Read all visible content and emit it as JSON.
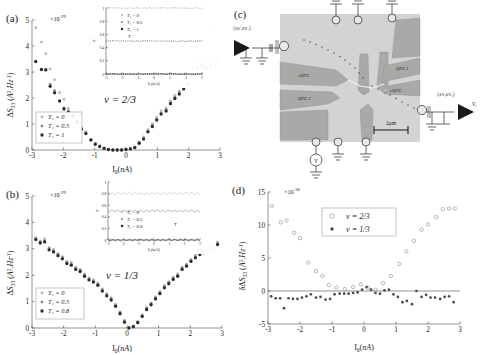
{
  "figure": {
    "panels": [
      "a",
      "b",
      "c",
      "d"
    ],
    "labels": {
      "a": "(a)",
      "b": "(b)",
      "c": "(c)",
      "d": "(d)"
    }
  },
  "panel_a": {
    "label": "(a)",
    "exponent": "×10",
    "exponent_sup": "-29",
    "annotation": "ν = 2/3",
    "legend": [
      {
        "marker": "light",
        "label": "T₁ = 0"
      },
      {
        "marker": "mid",
        "label": "T₁ = 0.5"
      },
      {
        "marker": "dark",
        "label": "T₁ = 1"
      }
    ],
    "inset": {
      "xlabel": "I₀(nA)",
      "ylabel": "T",
      "xticks": [
        "-3",
        "-2",
        "-1",
        "0",
        "1",
        "2",
        "3"
      ],
      "yticks": [
        "0",
        "0.2",
        "0.4",
        "0.6",
        "0.8",
        "1"
      ],
      "legend": [
        {
          "marker": "light",
          "label": "T₁ = 0"
        },
        {
          "marker": "mid",
          "label": "T₁ = 0.5"
        },
        {
          "marker": "dark",
          "label": "T₁ = 1"
        }
      ],
      "series_levels": [
        1.0,
        0.5,
        0.0
      ]
    },
    "chart_data": {
      "type": "scatter",
      "title": "",
      "xlabel": "I₀(nA)",
      "ylabel": "ΔS₃₃ (A².Hz⁻¹)",
      "xlim": [
        -3,
        3
      ],
      "ylim": [
        0,
        5
      ],
      "xticks": [
        -3,
        -2,
        -1,
        0,
        1,
        2,
        3
      ],
      "yticks": [
        0,
        1,
        2,
        3,
        4,
        5
      ],
      "yscale_exponent": -29,
      "grid": false,
      "legend_position": "lower-left",
      "series": [
        {
          "name": "T₁ = 0",
          "marker": "light",
          "x": [
            -2.88,
            -2.7,
            -2.56,
            -2.42,
            -2.28,
            -2.12,
            -1.98,
            -1.84,
            -1.7,
            -1.56,
            -1.42,
            -1.28,
            -1.12,
            -0.98,
            -0.84,
            -0.7,
            -0.56,
            -0.42,
            -0.28,
            -0.14,
            0,
            0.14,
            0.28,
            0.42,
            0.56,
            0.7,
            0.84,
            0.98,
            1.12,
            1.28,
            1.42,
            1.56,
            1.7,
            1.84,
            1.98,
            2.12,
            2.28,
            2.42,
            2.56,
            2.7,
            2.88
          ],
          "y": [
            4.7,
            4.15,
            3.7,
            3.12,
            2.7,
            2.2,
            1.95,
            1.6,
            1.42,
            1.12,
            0.86,
            0.7,
            0.42,
            0.26,
            0.16,
            0.08,
            0.03,
            0.0,
            0.0,
            0.0,
            0.03,
            0.05,
            0.12,
            0.3,
            0.5,
            0.78,
            1.0,
            1.25,
            1.5,
            1.62,
            1.9,
            2.1,
            2.26,
            2.55,
            2.8,
            3.1,
            3.35,
            3.6,
            4.15,
            4.6,
            4.72
          ]
        },
        {
          "name": "T₁ = 0.5",
          "marker": "mid",
          "x": [
            -2.88,
            -2.7,
            -2.56,
            -2.42,
            -2.28,
            -2.12,
            -1.98,
            -1.84,
            -1.7,
            -1.56,
            -1.42,
            -1.28,
            -1.12,
            -0.98,
            -0.84,
            -0.7,
            -0.56,
            -0.42,
            -0.28,
            -0.14,
            0,
            0.14,
            0.28,
            0.42,
            0.56,
            0.7,
            0.84,
            0.98,
            1.12,
            1.28,
            1.42,
            1.56,
            1.7,
            1.84,
            1.98,
            2.12,
            2.28,
            2.42,
            2.56,
            2.7,
            2.88
          ],
          "y": [
            3.42,
            3.08,
            3.1,
            2.52,
            2.28,
            1.9,
            1.62,
            1.5,
            1.35,
            1.08,
            0.82,
            0.66,
            0.4,
            0.24,
            0.15,
            0.07,
            0.02,
            0.0,
            0.0,
            0.0,
            0.02,
            0.05,
            0.1,
            0.28,
            0.45,
            0.72,
            0.95,
            1.18,
            1.42,
            1.55,
            1.82,
            2.02,
            2.2,
            2.42,
            2.6,
            2.9,
            3.18,
            3.3,
            3.2,
            3.25,
            3.3
          ]
        },
        {
          "name": "T₁ = 1",
          "marker": "dark",
          "x": [
            -2.88,
            -2.7,
            -2.56,
            -2.42,
            -2.28,
            -2.12,
            -1.98,
            -1.84,
            -1.7,
            -1.56,
            -1.42,
            -1.28,
            -1.12,
            -0.98,
            -0.84,
            -0.7,
            -0.56,
            -0.42,
            -0.28,
            -0.14,
            0,
            0.14,
            0.28,
            0.42,
            0.56,
            0.7,
            0.84,
            0.98,
            1.12,
            1.28,
            1.42,
            1.56,
            1.7,
            1.84,
            1.98,
            2.12,
            2.28,
            2.42,
            2.56,
            2.7,
            2.88
          ],
          "y": [
            3.4,
            3.1,
            3.08,
            2.45,
            2.2,
            1.88,
            1.58,
            1.45,
            1.3,
            1.05,
            0.8,
            0.63,
            0.38,
            0.22,
            0.13,
            0.06,
            0.02,
            0.0,
            0.0,
            0.0,
            0.02,
            0.04,
            0.09,
            0.26,
            0.42,
            0.7,
            0.9,
            1.15,
            1.38,
            1.5,
            1.78,
            1.98,
            2.15,
            2.35,
            2.55,
            2.85,
            3.12,
            3.22,
            3.15,
            3.2,
            3.58
          ]
        }
      ]
    }
  },
  "panel_b": {
    "label": "(b)",
    "exponent": "×10",
    "exponent_sup": "-29",
    "annotation": "ν = 1/3",
    "legend": [
      {
        "marker": "light",
        "label": "T₁ = 0"
      },
      {
        "marker": "mid",
        "label": "T₁ = 0.5"
      },
      {
        "marker": "dark",
        "label": "T₁ = 0.8"
      }
    ],
    "inset": {
      "xlabel": "I₀(nA)",
      "ylabel": "T",
      "xticks": [
        "-3",
        "-2",
        "-1",
        "0",
        "1",
        "2",
        "3"
      ],
      "yticks": [
        "0",
        "0.2",
        "0.4",
        "0.6",
        "0.8",
        "1"
      ],
      "legend": [
        {
          "marker": "light",
          "label": "T₁ = 0"
        },
        {
          "marker": "mid",
          "label": "T₁ = 0.5"
        },
        {
          "marker": "dark",
          "label": "T₁ = 0.8"
        }
      ],
      "series_levels": [
        0.8,
        0.5,
        0.0
      ]
    },
    "chart_data": {
      "type": "scatter",
      "title": "",
      "xlabel": "I₀(nA)",
      "ylabel": "ΔS₃₃ (A².Hz⁻¹)",
      "xlim": [
        -3,
        3
      ],
      "ylim": [
        0,
        5
      ],
      "xticks": [
        -3,
        -2,
        -1,
        0,
        1,
        2,
        3
      ],
      "yticks": [
        0,
        1,
        2,
        3,
        4,
        5
      ],
      "yscale_exponent": -29,
      "grid": false,
      "legend_position": "lower-left",
      "series": [
        {
          "name": "T₁ = 0",
          "marker": "light",
          "x": [
            -2.88,
            -2.74,
            -2.6,
            -2.46,
            -2.32,
            -2.18,
            -2.04,
            -1.9,
            -1.76,
            -1.62,
            -1.48,
            -1.34,
            -1.2,
            -1.06,
            -0.92,
            -0.78,
            -0.64,
            -0.5,
            -0.36,
            -0.22,
            -0.08,
            0.06,
            0.2,
            0.34,
            0.48,
            0.62,
            0.76,
            0.9,
            1.04,
            1.18,
            1.32,
            1.46,
            1.6,
            1.74,
            1.88,
            2.02,
            2.16,
            2.3,
            2.44,
            2.58,
            2.72,
            2.86
          ],
          "y": [
            3.42,
            3.3,
            3.38,
            3.05,
            2.98,
            2.82,
            2.7,
            2.52,
            2.48,
            2.3,
            2.22,
            2.05,
            1.9,
            1.82,
            1.7,
            1.48,
            1.3,
            1.15,
            0.9,
            0.62,
            0.3,
            0.02,
            0.08,
            0.25,
            0.5,
            0.78,
            0.95,
            1.18,
            1.38,
            1.6,
            1.75,
            1.92,
            2.05,
            2.3,
            2.42,
            2.6,
            2.75,
            2.85,
            2.95,
            3.02,
            3.1,
            3.25
          ]
        },
        {
          "name": "T₁ = 0.5",
          "marker": "mid",
          "x": [
            -2.88,
            -2.74,
            -2.6,
            -2.46,
            -2.32,
            -2.18,
            -2.04,
            -1.9,
            -1.76,
            -1.62,
            -1.48,
            -1.34,
            -1.2,
            -1.06,
            -0.92,
            -0.78,
            -0.64,
            -0.5,
            -0.36,
            -0.22,
            -0.08,
            0.06,
            0.2,
            0.34,
            0.48,
            0.62,
            0.76,
            0.9,
            1.04,
            1.18,
            1.32,
            1.46,
            1.6,
            1.74,
            1.88,
            2.02,
            2.16,
            2.3,
            2.44,
            2.58,
            2.72,
            2.86
          ],
          "y": [
            3.38,
            3.26,
            3.3,
            3.0,
            2.92,
            2.78,
            2.66,
            2.48,
            2.42,
            2.26,
            2.18,
            2.0,
            1.86,
            1.78,
            1.66,
            1.44,
            1.26,
            1.1,
            0.86,
            0.58,
            0.26,
            0.0,
            0.06,
            0.22,
            0.46,
            0.74,
            0.92,
            1.14,
            1.34,
            1.56,
            1.72,
            1.88,
            2.0,
            2.26,
            2.38,
            2.56,
            2.7,
            2.82,
            2.9,
            2.98,
            3.05,
            3.2
          ]
        },
        {
          "name": "T₁ = 0.8",
          "marker": "dark",
          "x": [
            -2.88,
            -2.74,
            -2.6,
            -2.46,
            -2.32,
            -2.18,
            -2.04,
            -1.9,
            -1.76,
            -1.62,
            -1.48,
            -1.34,
            -1.2,
            -1.06,
            -0.92,
            -0.78,
            -0.64,
            -0.5,
            -0.36,
            -0.22,
            -0.08,
            0.06,
            0.2,
            0.34,
            0.48,
            0.62,
            0.76,
            0.9,
            1.04,
            1.18,
            1.32,
            1.46,
            1.6,
            1.74,
            1.88,
            2.02,
            2.16,
            2.3,
            2.44,
            2.58,
            2.72,
            2.86
          ],
          "y": [
            3.35,
            3.22,
            3.26,
            2.96,
            2.88,
            2.74,
            2.62,
            2.44,
            2.38,
            2.22,
            2.14,
            1.96,
            1.82,
            1.74,
            1.62,
            1.4,
            1.22,
            1.06,
            0.82,
            0.54,
            0.22,
            0.0,
            0.05,
            0.2,
            0.44,
            0.7,
            0.88,
            1.1,
            1.3,
            1.52,
            1.68,
            1.84,
            1.96,
            2.22,
            2.34,
            2.52,
            2.66,
            2.78,
            2.86,
            2.94,
            3.0,
            3.16
          ]
        }
      ]
    }
  },
  "panel_c": {
    "label": "(c)",
    "type": "sem-micrograph",
    "scalebar": "2μm",
    "left_amp_label": "⟨δVₓδVₓ⟩",
    "left_output": "Vₓ",
    "right_amp_label": "⟨δVᵧδVᵧ⟩",
    "right_output": "Vᵧ",
    "source_label": "V",
    "gate_labels": [
      "cQPC",
      "QPC 2",
      "QPC 1",
      "cQPC"
    ]
  },
  "panel_d": {
    "label": "(d)",
    "exponent": "×10",
    "exponent_sup": "-30",
    "legend": [
      {
        "marker": "open",
        "label": "ν = 2/3"
      },
      {
        "marker": "filled",
        "label": "ν = 1/3"
      }
    ],
    "chart_data": {
      "type": "scatter",
      "title": "",
      "xlabel": "I₀(nA)",
      "ylabel": "δΔS₃₃ (A².Hz⁻¹)",
      "xlim": [
        -3,
        3
      ],
      "ylim": [
        -5,
        15
      ],
      "xticks": [
        -3,
        -2,
        -1,
        0,
        1,
        2,
        3
      ],
      "yticks": [
        -5,
        0,
        5,
        10,
        15
      ],
      "yscale_exponent": -30,
      "grid": false,
      "legend_position": "upper-center",
      "series": [
        {
          "name": "ν = 2/3",
          "marker": "open",
          "x": [
            -2.88,
            -2.6,
            -2.42,
            -2.18,
            -2.0,
            -1.74,
            -1.5,
            -1.3,
            -1.1,
            -0.86,
            -0.6,
            -0.34,
            -0.1,
            0.12,
            0.36,
            0.6,
            0.84,
            1.1,
            1.32,
            1.56,
            1.8,
            2.0,
            2.26,
            2.46,
            2.66,
            2.84
          ],
          "y": [
            12.9,
            10.4,
            10.7,
            8.8,
            8.0,
            4.3,
            3.0,
            2.3,
            0.9,
            0.5,
            0.3,
            0.6,
            1.0,
            0.5,
            0.2,
            1.2,
            2.3,
            4.1,
            6.0,
            7.6,
            9.3,
            10.1,
            11.2,
            12.4,
            12.5,
            12.5
          ]
        },
        {
          "name": "ν = 1/3",
          "marker": "filled",
          "x": [
            -2.9,
            -2.76,
            -2.62,
            -2.5,
            -2.36,
            -2.22,
            -2.08,
            -1.94,
            -1.8,
            -1.66,
            -1.5,
            -1.36,
            -1.2,
            -1.06,
            -0.92,
            -0.76,
            -0.62,
            -0.48,
            -0.34,
            -0.2,
            -0.06,
            0.08,
            0.22,
            0.36,
            0.5,
            0.64,
            0.78,
            0.92,
            1.06,
            1.2,
            1.34,
            1.5,
            1.64,
            1.8,
            1.94,
            2.08,
            2.22,
            2.38,
            2.52,
            2.66,
            2.8
          ],
          "y": [
            -0.8,
            -1.1,
            -1.1,
            -2.6,
            -1.1,
            -1.2,
            -1.2,
            -1.0,
            -0.8,
            -0.5,
            -1.0,
            -0.9,
            -1.3,
            -1.2,
            -0.5,
            -0.4,
            -0.4,
            -0.4,
            -0.3,
            -0.2,
            0.2,
            0.6,
            0.2,
            -0.3,
            -0.4,
            0.1,
            0.2,
            -0.5,
            -0.9,
            -1.7,
            -1.5,
            -2.0,
            0.0,
            -0.9,
            -0.6,
            -1.0,
            -1.0,
            -1.2,
            -0.9,
            -0.8,
            -1.7
          ]
        }
      ]
    }
  }
}
